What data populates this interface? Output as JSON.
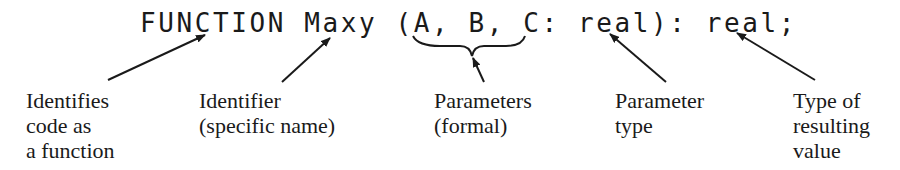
{
  "code_line": "FUNCTION Maxy (A, B, C: real): real;",
  "annotations": [
    {
      "id": "function-keyword",
      "target": "FUNCTION",
      "lines": [
        "Identifies",
        "code as",
        "a function"
      ]
    },
    {
      "id": "identifier",
      "target": "Maxy",
      "lines": [
        "Identifier",
        "(specific name)"
      ]
    },
    {
      "id": "parameters",
      "target": "A, B, C",
      "lines": [
        "Parameters",
        "(formal)"
      ]
    },
    {
      "id": "parameter-type",
      "target": "real",
      "lines": [
        "Parameter",
        "type"
      ]
    },
    {
      "id": "result-type",
      "target": "real",
      "lines": [
        "Type of",
        "resulting",
        "value"
      ]
    }
  ]
}
